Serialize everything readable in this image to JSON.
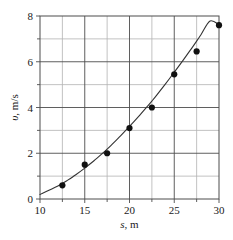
{
  "chart_data": {
    "type": "scatter",
    "title": "",
    "subtitle": "",
    "xlabel": "s, m",
    "ylabel": "υ, m/s",
    "xlabel_var": "s",
    "xlabel_unit": ", m",
    "ylabel_var": "υ",
    "ylabel_unit": ", m/s",
    "xlim": [
      10,
      30
    ],
    "ylim": [
      0,
      8
    ],
    "xticks": [
      10,
      15,
      20,
      25,
      30
    ],
    "yticks": [
      0,
      2,
      4,
      6,
      8
    ],
    "xtick_labels": [
      "10",
      "15",
      "20",
      "25",
      "30"
    ],
    "ytick_labels": [
      "0",
      "2",
      "4",
      "6",
      "8"
    ],
    "x_minor_step": 2.5,
    "y_minor_step": 1,
    "grid": true,
    "grid_major_color": "#4d4d4d",
    "grid_minor_color": "#b3b3b3",
    "legend": "none",
    "marker_color": "#111111",
    "marker_shape": "circle",
    "marker_size": 3.1,
    "line_color": "#333333",
    "line_width": 1.1,
    "points": [
      {
        "x": 12.5,
        "y": 0.6
      },
      {
        "x": 15.0,
        "y": 1.5
      },
      {
        "x": 17.5,
        "y": 2.0
      },
      {
        "x": 20.0,
        "y": 3.1
      },
      {
        "x": 22.5,
        "y": 4.0
      },
      {
        "x": 25.0,
        "y": 5.45
      },
      {
        "x": 27.5,
        "y": 6.45
      },
      {
        "x": 30.0,
        "y": 7.6
      }
    ],
    "x": [
      12.5,
      15.0,
      17.5,
      20.0,
      22.5,
      25.0,
      27.5,
      30.0
    ],
    "values": [
      0.6,
      1.5,
      2.0,
      3.1,
      4.0,
      5.45,
      6.45,
      7.6
    ],
    "fit_curve": [
      {
        "x": 10.0,
        "y": 0.2
      },
      {
        "x": 11.0,
        "y": 0.38
      },
      {
        "x": 12.0,
        "y": 0.57
      },
      {
        "x": 12.5,
        "y": 0.68
      },
      {
        "x": 13.0,
        "y": 0.8
      },
      {
        "x": 14.0,
        "y": 1.06
      },
      {
        "x": 15.0,
        "y": 1.35
      },
      {
        "x": 16.0,
        "y": 1.66
      },
      {
        "x": 17.0,
        "y": 2.0
      },
      {
        "x": 17.5,
        "y": 2.18
      },
      {
        "x": 18.0,
        "y": 2.37
      },
      {
        "x": 19.0,
        "y": 2.76
      },
      {
        "x": 20.0,
        "y": 3.17
      },
      {
        "x": 21.0,
        "y": 3.6
      },
      {
        "x": 22.0,
        "y": 4.05
      },
      {
        "x": 22.5,
        "y": 4.28
      },
      {
        "x": 23.0,
        "y": 4.52
      },
      {
        "x": 24.0,
        "y": 5.02
      },
      {
        "x": 25.0,
        "y": 5.54
      },
      {
        "x": 26.0,
        "y": 6.07
      },
      {
        "x": 27.0,
        "y": 6.62
      },
      {
        "x": 27.5,
        "y": 6.9
      },
      {
        "x": 28.0,
        "y": 7.19
      },
      {
        "x": 29.0,
        "y": 7.78
      },
      {
        "x": 30.0,
        "y": 7.62
      }
    ],
    "plot_area": {
      "left": 40,
      "top": 16,
      "right": 219,
      "bottom": 199
    }
  }
}
